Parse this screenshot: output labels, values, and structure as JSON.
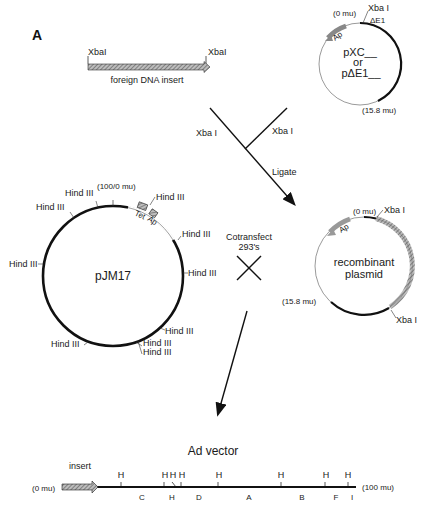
{
  "panel_label": "A",
  "insert": {
    "left_site": "XbaI",
    "right_site": "XbaI",
    "label": "foreign DNA insert"
  },
  "shuttle_plasmid": {
    "name_line1": "pXC__",
    "name_line2": "or",
    "name_line3": "pΔE1__",
    "start_mu": "(0 mu)",
    "end_mu": "(15.8 mu)",
    "site": "Xba I",
    "deletion": "ΔE1",
    "marker": "Ap"
  },
  "ligation": {
    "left_site": "Xba I",
    "right_site": "Xba I",
    "step": "Ligate"
  },
  "pjm17": {
    "name": "pJM17",
    "position_mu": "(100/0 mu)",
    "markers": [
      "Tet",
      "Ap"
    ],
    "sites": [
      "Hind III",
      "Hind III",
      "Hind III",
      "Hind III",
      "Hind III",
      "Hind III",
      "Hind III",
      "Hind III",
      "Hind III",
      "Hind III"
    ]
  },
  "cotransfect": {
    "line1": "Cotransfect",
    "line2": "293's"
  },
  "recombinant": {
    "name_line1": "recombinant",
    "name_line2": "plasmid",
    "start_mu": "(0 mu)",
    "end_mu": "(15.8 mu)",
    "site_top": "Xba I",
    "site_bottom": "Xba I",
    "marker": "Ap"
  },
  "ad_vector": {
    "title": "Ad vector",
    "insert_label": "insert",
    "start_mu": "(0 mu)",
    "end_mu": "(100 mu)",
    "site_marks": [
      "H",
      "H",
      "H",
      "H",
      "H",
      "H",
      "H",
      "H"
    ],
    "fragments": [
      "C",
      "H",
      "D",
      "A",
      "B",
      "F",
      "I"
    ]
  }
}
